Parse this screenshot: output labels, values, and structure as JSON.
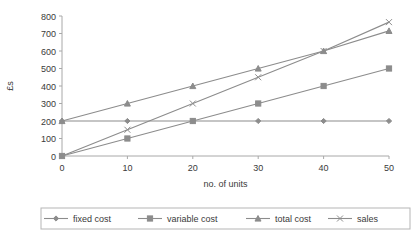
{
  "chart_data": {
    "type": "line",
    "title": "",
    "xlabel": "no. of units",
    "ylabel": "£s",
    "x": [
      0,
      10,
      20,
      30,
      40,
      50
    ],
    "xlim": [
      0,
      50
    ],
    "ylim": [
      0,
      800
    ],
    "xticks": [
      "0",
      "10",
      "20",
      "30",
      "40",
      "50"
    ],
    "yticks": [
      "0",
      "100",
      "200",
      "300",
      "400",
      "500",
      "600",
      "700",
      "800"
    ],
    "grid": false,
    "legend_position": "bottom",
    "series": [
      {
        "name": "fixed cost",
        "marker": "diamond",
        "color": "#8c8c8c",
        "values": [
          200,
          200,
          200,
          200,
          200,
          200
        ]
      },
      {
        "name": "variable cost",
        "marker": "square",
        "color": "#8c8c8c",
        "values": [
          0,
          100,
          200,
          300,
          400,
          500
        ]
      },
      {
        "name": "total cost",
        "marker": "triangle",
        "color": "#8c8c8c",
        "values": [
          200,
          300,
          400,
          500,
          600,
          715
        ]
      },
      {
        "name": "sales",
        "marker": "cross",
        "color": "#8c8c8c",
        "values": [
          0,
          150,
          300,
          450,
          600,
          765
        ]
      }
    ]
  },
  "legend": {
    "items": [
      {
        "label": "fixed cost",
        "marker": "diamond"
      },
      {
        "label": "variable cost",
        "marker": "square"
      },
      {
        "label": "total cost",
        "marker": "triangle"
      },
      {
        "label": "sales",
        "marker": "cross"
      }
    ]
  },
  "colors": {
    "line": "#8c8c8c",
    "axis": "#a8a8a8",
    "text": "#3a3a3a",
    "legend_border": "#b5b5b5",
    "background": "#ffffff"
  }
}
